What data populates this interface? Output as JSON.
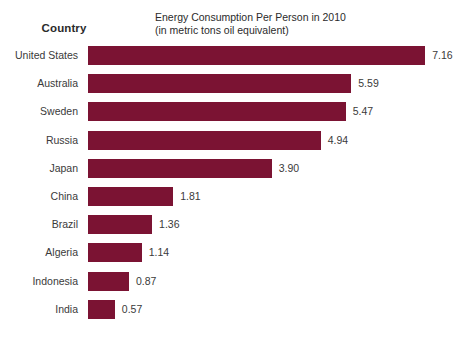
{
  "header": {
    "country_column_label": "Country",
    "title_line1": "Energy Consumption Per Person in 2010",
    "title_line2": "(in metric tons oil equivalent)"
  },
  "chart_data": {
    "type": "bar",
    "orientation": "horizontal",
    "title": "Energy Consumption Per Person in 2010 (in metric tons oil equivalent)",
    "subtitle": "(in metric tons oil equivalent)",
    "xlabel": "",
    "ylabel": "Country",
    "grid": false,
    "legend": false,
    "xlim": [
      0,
      7.16
    ],
    "bar_color": "#7b1333",
    "label_color": "#3a3a3a",
    "background": "#ffffff",
    "categories": [
      "United States",
      "Australia",
      "Sweden",
      "Russia",
      "Japan",
      "China",
      "Brazil",
      "Algeria",
      "Indonesia",
      "India"
    ],
    "values": [
      7.16,
      5.59,
      5.47,
      4.94,
      3.9,
      1.81,
      1.36,
      1.14,
      0.87,
      0.57
    ],
    "value_labels": [
      "7.16",
      "5.59",
      "5.47",
      "4.94",
      "3.90",
      "1.81",
      "1.36",
      "1.14",
      "0.87",
      "0.57"
    ]
  }
}
